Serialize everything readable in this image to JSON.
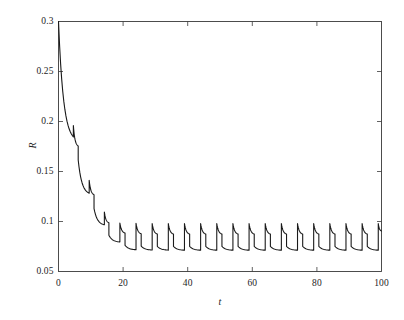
{
  "chart_data": {
    "type": "line",
    "title": "",
    "xlabel": "t",
    "ylabel": "R",
    "xlim": [
      0,
      100
    ],
    "ylim": [
      0.05,
      0.3
    ],
    "xticks": [
      0,
      20,
      40,
      60,
      80,
      100
    ],
    "xtick_labels": [
      "0",
      "20",
      "40",
      "60",
      "80",
      "100"
    ],
    "yticks": [
      0.05,
      0.1,
      0.15,
      0.2,
      0.25,
      0.3
    ],
    "ytick_labels": [
      "0.05",
      "0.1",
      "0.15",
      "0.2",
      "0.25",
      "0.3"
    ],
    "grid": false,
    "legend": null,
    "series": [
      {
        "name": "R(t)",
        "line_color": "#1a1a1a",
        "line_width": 1.1,
        "description": "Damped sawtooth: monotonic decay from R=0.3 at t=0 with periodic sharp upward jumps every ~5 time units, settling into a steady-state cycle oscillating between about 0.072 and 0.098.",
        "period": 5,
        "start_value": 0.3,
        "steady_peak": 0.098,
        "steady_trough": 0.072,
        "points": [
          [
            0,
            0.3
          ],
          [
            4.6,
            0.1845
          ],
          [
            4.6,
            0.196
          ],
          [
            6.1,
            0.1755
          ],
          [
            6.1,
            0.1615
          ],
          [
            9.5,
            0.1283
          ],
          [
            9.5,
            0.1412
          ],
          [
            11.0,
            0.1268
          ],
          [
            11.0,
            0.1128
          ],
          [
            14.2,
            0.0967
          ],
          [
            14.2,
            0.1095
          ],
          [
            15.6,
            0.0988
          ],
          [
            15.6,
            0.0862
          ],
          [
            19.0,
            0.0795
          ],
          [
            19.0,
            0.0985
          ],
          [
            20.6,
            0.0885
          ],
          [
            20.6,
            0.0762
          ],
          [
            24.0,
            0.0718
          ],
          [
            24.0,
            0.0982
          ],
          [
            25.6,
            0.0878
          ],
          [
            25.6,
            0.0755
          ],
          [
            29.0,
            0.0715
          ],
          [
            29.0,
            0.098
          ],
          [
            30.6,
            0.0875
          ],
          [
            30.6,
            0.0752
          ],
          [
            34.0,
            0.0714
          ],
          [
            34.0,
            0.098
          ],
          [
            35.6,
            0.0874
          ],
          [
            35.6,
            0.0751
          ],
          [
            39.0,
            0.0713
          ],
          [
            39.0,
            0.098
          ],
          [
            40.6,
            0.0874
          ],
          [
            40.6,
            0.0751
          ],
          [
            44.0,
            0.0713
          ],
          [
            44.0,
            0.098
          ],
          [
            45.6,
            0.0874
          ],
          [
            45.6,
            0.0751
          ],
          [
            49.0,
            0.0713
          ],
          [
            49.0,
            0.098
          ],
          [
            50.6,
            0.0874
          ],
          [
            50.6,
            0.0751
          ],
          [
            54.0,
            0.0713
          ],
          [
            54.0,
            0.098
          ],
          [
            55.6,
            0.0874
          ],
          [
            55.6,
            0.0751
          ],
          [
            59.0,
            0.0713
          ],
          [
            59.0,
            0.098
          ],
          [
            60.6,
            0.0874
          ],
          [
            60.6,
            0.0751
          ],
          [
            64.0,
            0.0713
          ],
          [
            64.0,
            0.098
          ],
          [
            65.6,
            0.0874
          ],
          [
            65.6,
            0.0751
          ],
          [
            69.0,
            0.0713
          ],
          [
            69.0,
            0.098
          ],
          [
            70.6,
            0.0874
          ],
          [
            70.6,
            0.0751
          ],
          [
            74.0,
            0.0713
          ],
          [
            74.0,
            0.098
          ],
          [
            75.6,
            0.0874
          ],
          [
            75.6,
            0.0751
          ],
          [
            79.0,
            0.0713
          ],
          [
            79.0,
            0.098
          ],
          [
            80.6,
            0.0874
          ],
          [
            80.6,
            0.0751
          ],
          [
            84.0,
            0.0713
          ],
          [
            84.0,
            0.098
          ],
          [
            85.6,
            0.0874
          ],
          [
            85.6,
            0.0751
          ],
          [
            89.0,
            0.0713
          ],
          [
            89.0,
            0.098
          ],
          [
            90.6,
            0.0874
          ],
          [
            90.6,
            0.0751
          ],
          [
            94.0,
            0.0713
          ],
          [
            94.0,
            0.098
          ],
          [
            95.6,
            0.0874
          ],
          [
            95.6,
            0.0751
          ],
          [
            99.0,
            0.0713
          ],
          [
            99.0,
            0.098
          ],
          [
            100,
            0.0905
          ]
        ]
      }
    ]
  },
  "axes": {
    "x_title": "t",
    "y_title": "R"
  },
  "style": {
    "background": "#ffffff",
    "frame_color": "#3a3a3a",
    "curve_color": "#1a1a1a",
    "tick_color": "#3a3a3a"
  }
}
